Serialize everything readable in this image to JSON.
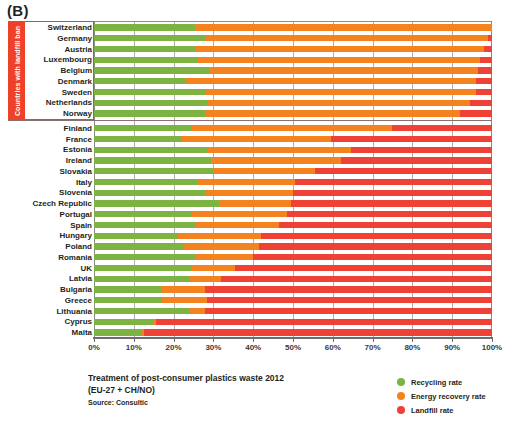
{
  "panel": {
    "letter": "(B)"
  },
  "side_tag": {
    "text": "Countries with landfill ban"
  },
  "caption": {
    "line1": "Treatment of post-consumer plastics waste 2012",
    "line2": "(EU-27 + CH/NO)",
    "source": "Source: Consultic"
  },
  "legend": {
    "items": [
      {
        "label": "Recycling rate",
        "color": "#7cb342",
        "icon": "circle-marker-icon"
      },
      {
        "label": "Energy recovery rate",
        "color": "#f4821f",
        "icon": "circle-marker-icon"
      },
      {
        "label": "Landfill rate",
        "color": "#ef4136",
        "icon": "circle-marker-icon"
      }
    ]
  },
  "axis": {
    "ticks": [
      "0%",
      "10%",
      "20%",
      "30%",
      "40%",
      "50%",
      "60%",
      "70%",
      "80%",
      "90%",
      "100%"
    ]
  },
  "chart_data": {
    "type": "bar",
    "orientation": "horizontal",
    "stacked": true,
    "normalized_percent": true,
    "title": "Treatment of post-consumer plastics waste 2012",
    "subtitle": "(EU-27 + CH/NO)",
    "source": "Source: Consultic",
    "xlabel": "",
    "ylabel": "",
    "xlim": [
      0,
      100
    ],
    "xticks": [
      0,
      10,
      20,
      30,
      40,
      50,
      60,
      70,
      80,
      90,
      100
    ],
    "grid": true,
    "legend_position": "bottom-right",
    "series": [
      {
        "name": "Recycling rate",
        "color": "#7cb342"
      },
      {
        "name": "Energy recovery rate",
        "color": "#f4821f"
      },
      {
        "name": "Landfill rate",
        "color": "#ef4136"
      }
    ],
    "groups": [
      {
        "name": "Countries with landfill ban",
        "categories": [
          "Switzerland",
          "Germany",
          "Austria",
          "Luxembourg",
          "Belgium",
          "Denmark",
          "Sweden",
          "Netherlands",
          "Norway"
        ],
        "values": [
          [
            25.5,
            74.5,
            0.0
          ],
          [
            28.0,
            71.0,
            1.0
          ],
          [
            25.5,
            72.5,
            2.0
          ],
          [
            26.0,
            71.0,
            3.0
          ],
          [
            29.0,
            67.5,
            3.5
          ],
          [
            23.0,
            73.0,
            4.0
          ],
          [
            28.0,
            68.0,
            4.0
          ],
          [
            28.5,
            66.0,
            5.5
          ],
          [
            28.0,
            64.0,
            8.0
          ]
        ]
      },
      {
        "name": "Other countries",
        "categories": [
          "Finland",
          "France",
          "Estonia",
          "Ireland",
          "Slovakia",
          "Italy",
          "Slovenia",
          "Czech Republic",
          "Portugal",
          "Spain",
          "Hungary",
          "Poland",
          "Romania",
          "UK",
          "Latvia",
          "Bulgaria",
          "Greece",
          "Lithuania",
          "Cyprus",
          "Malta"
        ],
        "values": [
          [
            24.5,
            50.5,
            25.0
          ],
          [
            22.0,
            37.5,
            40.5
          ],
          [
            28.5,
            36.0,
            35.5
          ],
          [
            29.5,
            32.5,
            38.0
          ],
          [
            30.0,
            25.5,
            44.5
          ],
          [
            26.0,
            24.5,
            49.5
          ],
          [
            28.0,
            22.0,
            50.0
          ],
          [
            31.5,
            18.0,
            50.5
          ],
          [
            24.5,
            24.0,
            51.5
          ],
          [
            25.5,
            21.0,
            53.5
          ],
          [
            21.0,
            21.0,
            58.0
          ],
          [
            22.5,
            19.0,
            58.5
          ],
          [
            25.5,
            14.5,
            60.0
          ],
          [
            24.5,
            11.0,
            64.5
          ],
          [
            24.0,
            8.0,
            68.0
          ],
          [
            17.0,
            11.0,
            72.0
          ],
          [
            17.0,
            11.5,
            71.5
          ],
          [
            24.0,
            4.0,
            72.0
          ],
          [
            15.0,
            0.5,
            84.5
          ],
          [
            12.0,
            0.5,
            87.5
          ]
        ]
      }
    ]
  }
}
